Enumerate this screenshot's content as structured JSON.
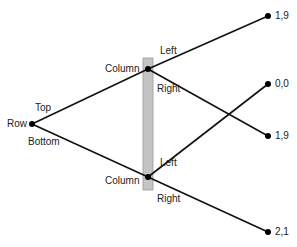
{
  "diagram": {
    "type": "game-tree",
    "colors": {
      "line": "#111111",
      "info_set": "#c4c4c4",
      "info_set_border": "#9a9a9a",
      "node": "#000000"
    },
    "root": {
      "player": "Row"
    },
    "root_actions": {
      "top": "Top",
      "bottom": "Bottom"
    },
    "column_nodes": {
      "upper": {
        "player": "Column",
        "left": "Left",
        "right": "Right"
      },
      "lower": {
        "player": "Column",
        "left": "Left",
        "right": "Right"
      }
    },
    "payoffs": {
      "top_left": "1,9",
      "top_right": "1,9",
      "bottom_left": "0,0",
      "bottom_right": "2,1"
    }
  }
}
